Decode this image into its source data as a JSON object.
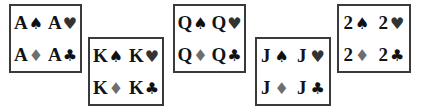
{
  "diagram": {
    "kind": "playing-card-rank-suit-grid",
    "background_color": "#ffffff",
    "border_color": "#3a3a3a",
    "suit_glyphs": {
      "spade": "♠",
      "heart": "♥",
      "diamond": "♦",
      "club": "♣"
    },
    "suit_colors": {
      "spade": "#111111",
      "heart": "#333333",
      "diamond": "#6e6e6e",
      "club": "#111111"
    },
    "groups": [
      {
        "name": "aces",
        "rank": "A",
        "cells": [
          {
            "rank": "A",
            "suit": "♠",
            "suit_name": "spade"
          },
          {
            "rank": "A",
            "suit": "♥",
            "suit_name": "heart"
          },
          {
            "rank": "A",
            "suit": "♦",
            "suit_name": "diamond"
          },
          {
            "rank": "A",
            "suit": "♣",
            "suit_name": "club"
          }
        ]
      },
      {
        "name": "kings",
        "rank": "K",
        "cells": [
          {
            "rank": "K",
            "suit": "♠",
            "suit_name": "spade"
          },
          {
            "rank": "K",
            "suit": "♥",
            "suit_name": "heart"
          },
          {
            "rank": "K",
            "suit": "♦",
            "suit_name": "diamond"
          },
          {
            "rank": "K",
            "suit": "♣",
            "suit_name": "club"
          }
        ]
      },
      {
        "name": "queens",
        "rank": "Q",
        "cells": [
          {
            "rank": "Q",
            "suit": "♠",
            "suit_name": "spade"
          },
          {
            "rank": "Q",
            "suit": "♥",
            "suit_name": "heart"
          },
          {
            "rank": "Q",
            "suit": "♦",
            "suit_name": "diamond"
          },
          {
            "rank": "Q",
            "suit": "♣",
            "suit_name": "club"
          }
        ]
      },
      {
        "name": "jacks",
        "rank": "J",
        "cells": [
          {
            "rank": "J",
            "suit": "♠",
            "suit_name": "spade"
          },
          {
            "rank": "J",
            "suit": "♥",
            "suit_name": "heart"
          },
          {
            "rank": "J",
            "suit": "♦",
            "suit_name": "diamond"
          },
          {
            "rank": "J",
            "suit": "♣",
            "suit_name": "club"
          }
        ]
      },
      {
        "name": "twos",
        "rank": "2",
        "cells": [
          {
            "rank": "2",
            "suit": "♠",
            "suit_name": "spade"
          },
          {
            "rank": "2",
            "suit": "♥",
            "suit_name": "heart"
          },
          {
            "rank": "2",
            "suit": "♦",
            "suit_name": "diamond"
          },
          {
            "rank": "2",
            "suit": "♣",
            "suit_name": "club"
          }
        ]
      }
    ]
  }
}
